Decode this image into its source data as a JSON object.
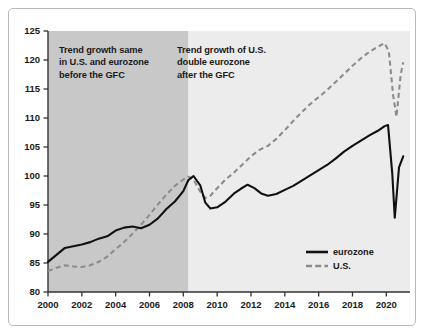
{
  "chart_data": {
    "type": "line",
    "title": "",
    "subtitle": "",
    "xlabel": "",
    "ylabel": "",
    "xlim": [
      2000,
      2021.4
    ],
    "ylim": [
      80,
      125
    ],
    "grid": false,
    "legend_position": "bottom-right",
    "y_ticks": [
      80,
      85,
      90,
      95,
      100,
      105,
      110,
      115,
      120,
      125
    ],
    "x_ticks": [
      2000,
      2002,
      2004,
      2006,
      2008,
      2010,
      2012,
      2014,
      2016,
      2018,
      2020
    ],
    "shaded_regions": [
      {
        "name": "pre-GFC",
        "x_start": 2000,
        "x_end": 2008.3,
        "color": "#c8c8c8"
      },
      {
        "name": "post-GFC",
        "x_start": 2008.3,
        "x_end": 2021.4,
        "color": "#ececec"
      }
    ],
    "series": [
      {
        "name": "eurozone",
        "style": "solid",
        "color": "#111111",
        "x": [
          2000,
          2000.5,
          2001,
          2001.5,
          2002,
          2002.5,
          2003,
          2003.5,
          2004,
          2004.5,
          2005,
          2005.5,
          2006,
          2006.5,
          2007,
          2007.5,
          2008,
          2008.3,
          2008.6,
          2009,
          2009.3,
          2009.6,
          2010,
          2010.5,
          2011,
          2011.4,
          2011.8,
          2012.2,
          2012.6,
          2013,
          2013.5,
          2014,
          2014.5,
          2015,
          2015.5,
          2016,
          2016.5,
          2017,
          2017.5,
          2018,
          2018.5,
          2019,
          2019.5,
          2019.9,
          2020.1,
          2020.35,
          2020.5,
          2020.75,
          2021
        ],
        "values": [
          85.2,
          86.4,
          87.6,
          87.9,
          88.2,
          88.6,
          89.2,
          89.6,
          90.6,
          91.1,
          91.3,
          91.0,
          91.6,
          92.7,
          94.3,
          95.6,
          97.4,
          99.3,
          100.0,
          98.4,
          95.4,
          94.4,
          94.6,
          95.6,
          97.0,
          97.8,
          98.5,
          97.9,
          97.0,
          96.6,
          96.9,
          97.6,
          98.3,
          99.2,
          100.1,
          101.0,
          101.9,
          103.0,
          104.2,
          105.2,
          106.1,
          107.0,
          107.8,
          108.6,
          108.8,
          100.5,
          92.8,
          101.5,
          103.4
        ]
      },
      {
        "name": "U.S.",
        "style": "dashed",
        "color": "#8c8c8c",
        "x": [
          2000,
          2000.5,
          2001,
          2001.5,
          2002,
          2002.5,
          2003,
          2003.5,
          2004,
          2004.5,
          2005,
          2005.5,
          2006,
          2006.5,
          2007,
          2007.5,
          2008,
          2008.3,
          2008.6,
          2009,
          2009.3,
          2009.6,
          2010,
          2010.5,
          2011,
          2011.5,
          2012,
          2012.5,
          2013,
          2013.5,
          2014,
          2014.5,
          2015,
          2015.5,
          2016,
          2016.5,
          2017,
          2017.5,
          2018,
          2018.5,
          2019,
          2019.5,
          2019.9,
          2020.15,
          2020.4,
          2020.6,
          2020.85,
          2021
        ],
        "values": [
          83.6,
          84.2,
          84.6,
          84.4,
          84.3,
          84.6,
          85.2,
          86.1,
          87.4,
          88.6,
          90.1,
          91.6,
          93.3,
          95.1,
          96.8,
          98.3,
          99.4,
          99.9,
          99.4,
          97.3,
          96.2,
          96.6,
          97.9,
          99.4,
          100.6,
          102.0,
          103.4,
          104.5,
          105.2,
          106.4,
          107.9,
          109.5,
          111.0,
          112.4,
          113.6,
          114.8,
          116.2,
          117.6,
          119.0,
          120.3,
          121.4,
          122.3,
          122.9,
          121.5,
          114.0,
          110.2,
          117.5,
          119.6
        ]
      }
    ],
    "annotations": [
      {
        "name": "pre-gfc-note",
        "lines": [
          "Trend growth same",
          "in U.S. and eurozone",
          "before the GFC"
        ]
      },
      {
        "name": "post-gfc-note",
        "lines": [
          "Trend growth of U.S.",
          "double eurozone",
          "after the GFC"
        ]
      }
    ],
    "legend_entries": [
      {
        "label": "eurozone",
        "style": "solid",
        "color": "#111111"
      },
      {
        "label": "U.S.",
        "style": "dashed",
        "color": "#8c8c8c"
      }
    ],
    "colors": {
      "eurozone": "#111111",
      "us": "#8c8c8c",
      "shade_dark": "#c8c8c8",
      "shade_light": "#ececec",
      "axis": "#333333",
      "frame": "#b9b9b9"
    }
  }
}
